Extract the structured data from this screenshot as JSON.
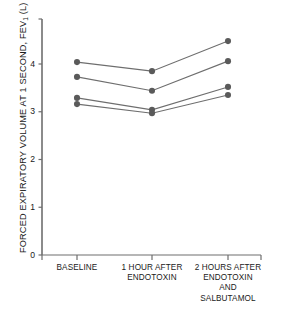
{
  "chart_data": {
    "type": "line",
    "title": "",
    "subtitle": "",
    "xlabel": "",
    "ylabel": "FORCED EXPIRATORY VOLUME AT 1 SECOND, FEV1 (L)",
    "ylabel_parts": {
      "before": "FORCED EXPIRATORY VOLUME AT 1 SECOND, FEV",
      "subscript": "1",
      "after": " (L)"
    },
    "categories": [
      "BASELINE",
      "1 HOUR AFTER ENDOTOXIN",
      "2 HOURS AFTER ENDOTOXIN AND SALBUTAMOL"
    ],
    "category_lines": [
      [
        "BASELINE"
      ],
      [
        "1 HOUR AFTER",
        "ENDOTOXIN"
      ],
      [
        "2 HOURS AFTER",
        "ENDOTOXIN",
        "AND",
        "SALBUTAMOL"
      ]
    ],
    "ylim": [
      0,
      4.75
    ],
    "yticks": [
      0,
      1,
      2,
      3,
      4
    ],
    "ytick_labels": [
      "0",
      "1",
      "2",
      "3",
      "4"
    ],
    "grid": false,
    "legend": "none",
    "marker": "filled-circle",
    "marker_color": "#5a5a5a",
    "line_color": "#6e6e6e",
    "axis_color": "#6e6e6e",
    "series": [
      {
        "name": "Subject 1",
        "values": [
          4.04,
          3.85,
          4.48
        ]
      },
      {
        "name": "Subject 2",
        "values": [
          3.73,
          3.44,
          4.06
        ]
      },
      {
        "name": "Subject 3",
        "values": [
          3.29,
          3.04,
          3.52
        ]
      },
      {
        "name": "Subject 4",
        "values": [
          3.16,
          2.97,
          3.35
        ]
      }
    ]
  }
}
